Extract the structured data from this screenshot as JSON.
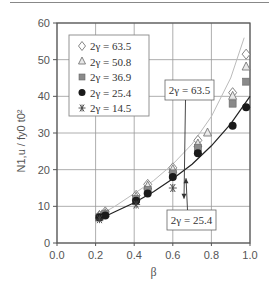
{
  "chart_data": {
    "type": "scatter",
    "title": "",
    "xlabel": "β",
    "ylabel": "N1,u / fy0 t0²",
    "xlim": [
      0.0,
      1.0
    ],
    "ylim": [
      0,
      60
    ],
    "xticks": [
      "0.0",
      "0.2",
      "0.4",
      "0.6",
      "0.8",
      "1.0"
    ],
    "yticks": [
      "0",
      "10",
      "20",
      "30",
      "40",
      "50",
      "60"
    ],
    "grid": true,
    "legend_position": "upper-left",
    "series": [
      {
        "name": "2γ = 63.5",
        "marker": "diamond-open",
        "x": [
          0.22,
          0.25,
          0.41,
          0.47,
          0.6,
          0.73,
          0.91,
          0.98
        ],
        "y": [
          7.5,
          8.5,
          13.0,
          16.0,
          20.5,
          28.0,
          41.0,
          51.5
        ]
      },
      {
        "name": "2γ = 50.8",
        "marker": "triangle-open",
        "x": [
          0.22,
          0.25,
          0.41,
          0.47,
          0.6,
          0.73,
          0.78,
          0.91,
          0.98
        ],
        "y": [
          7.5,
          8.0,
          12.5,
          15.5,
          20.0,
          27.0,
          30.0,
          40.0,
          48.0
        ]
      },
      {
        "name": "2γ = 36.9",
        "marker": "square-gray",
        "x": [
          0.22,
          0.25,
          0.41,
          0.47,
          0.6,
          0.73,
          0.91,
          0.98
        ],
        "y": [
          7.0,
          8.0,
          12.0,
          14.5,
          19.0,
          26.0,
          38.0,
          44.0
        ]
      },
      {
        "name": "2γ = 25.4",
        "marker": "circle-filled",
        "x": [
          0.22,
          0.25,
          0.41,
          0.47,
          0.6,
          0.73,
          0.91,
          0.98
        ],
        "y": [
          7.0,
          7.5,
          11.5,
          13.5,
          18.0,
          24.5,
          32.0,
          37.0
        ]
      },
      {
        "name": "2γ = 14.5",
        "marker": "asterisk",
        "x": [
          0.22,
          0.41,
          0.6
        ],
        "y": [
          6.5,
          10.5,
          15.0
        ]
      }
    ],
    "curves": [
      {
        "name": "fit 2γ = 63.5",
        "color": "#bbbbbb",
        "x": [
          0.2,
          0.3,
          0.4,
          0.5,
          0.6,
          0.7,
          0.8,
          0.9,
          0.97
        ],
        "y": [
          7.0,
          10.0,
          13.5,
          17.0,
          21.5,
          27.0,
          34.5,
          45.0,
          56.0
        ]
      },
      {
        "name": "fit 2γ = 25.4",
        "color": "#222222",
        "x": [
          0.2,
          0.3,
          0.4,
          0.5,
          0.6,
          0.7,
          0.8,
          0.9,
          1.0
        ],
        "y": [
          6.0,
          8.5,
          11.0,
          14.0,
          17.5,
          21.5,
          26.5,
          32.5,
          40.0
        ]
      }
    ],
    "annotations": [
      {
        "text": "2γ = 63.5",
        "arrow_to": [
          0.55,
          23
        ]
      },
      {
        "text": "2γ = 25.4",
        "arrow_to": [
          0.65,
          18.5
        ]
      }
    ]
  },
  "legend": {
    "items": [
      {
        "label": "2γ = 63.5"
      },
      {
        "label": "2γ = 50.8"
      },
      {
        "label": "2γ = 36.9"
      },
      {
        "label": "2γ = 25.4"
      },
      {
        "label": "2γ = 14.5"
      }
    ]
  },
  "axes": {
    "xlabel": "β",
    "ylabel": "N1,u / fy0 t0²"
  },
  "colors": {
    "grid": "#999999",
    "axis": "#555555",
    "square_fill": "#8a8a8a",
    "circle_fill": "#1a1a1a",
    "light_curve": "#bbbbbb",
    "dark_curve": "#222222"
  }
}
